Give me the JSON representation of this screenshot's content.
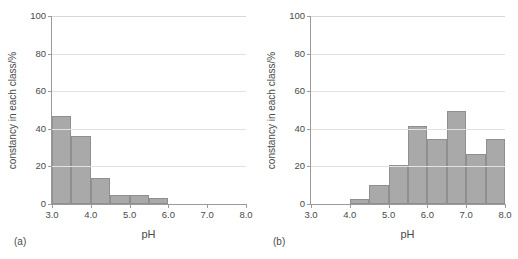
{
  "figure": {
    "background": "#ffffff",
    "bar_fill": "#a9a9a9",
    "bar_edge": "#8f8f8f",
    "axis_color": "#9a9a9a",
    "grid_color": "#e2e2e2"
  },
  "panels": [
    {
      "tag": "(a)",
      "xlabel": "pH",
      "ylabel": "constancy in each class/%"
    },
    {
      "tag": "(b)",
      "xlabel": "pH",
      "ylabel": "constancy in each class/%"
    }
  ],
  "chart_data": [
    {
      "type": "bar",
      "title": "",
      "panel": "(a)",
      "xlabel": "pH",
      "ylabel": "constancy in each class/%",
      "xlim": [
        3.0,
        8.0
      ],
      "ylim": [
        0,
        100
      ],
      "xticks": [
        3.0,
        4.0,
        5.0,
        6.0,
        7.0,
        8.0
      ],
      "xtick_labels": [
        "3.0",
        "4.0",
        "5.0",
        "6.0",
        "7.0",
        "8.0"
      ],
      "yticks": [
        0,
        20,
        40,
        60,
        80,
        100
      ],
      "ytick_labels": [
        "0",
        "20",
        "40",
        "60",
        "80",
        "100"
      ],
      "grid": "horizontal",
      "legend": "none",
      "bin_edges": [
        3.0,
        3.5,
        4.0,
        4.5,
        5.0,
        5.5,
        6.0
      ],
      "categories": [
        "3.0-3.5",
        "3.5-4.0",
        "4.0-4.5",
        "4.5-5.0",
        "5.0-5.5",
        "5.5-6.0"
      ],
      "values": [
        47,
        36,
        14,
        5,
        5,
        3
      ]
    },
    {
      "type": "bar",
      "title": "",
      "panel": "(b)",
      "xlabel": "pH",
      "ylabel": "constancy in each class/%",
      "xlim": [
        3.0,
        8.0
      ],
      "ylim": [
        0,
        100
      ],
      "xticks": [
        3.0,
        4.0,
        5.0,
        6.0,
        7.0,
        8.0
      ],
      "xtick_labels": [
        "3.0",
        "4.0",
        "5.0",
        "6.0",
        "7.0",
        "8.0"
      ],
      "yticks": [
        0,
        20,
        40,
        60,
        80,
        100
      ],
      "ytick_labels": [
        "0",
        "20",
        "40",
        "60",
        "80",
        "100"
      ],
      "grid": "horizontal",
      "legend": "none",
      "bin_edges": [
        4.0,
        4.5,
        5.0,
        5.5,
        6.0,
        6.5,
        7.0,
        7.5,
        8.0
      ],
      "categories": [
        "4.0-4.5",
        "4.5-5.0",
        "5.0-5.5",
        "5.5-6.0",
        "6.0-6.5",
        "6.5-7.0",
        "7.0-7.5",
        "7.5-8.0"
      ],
      "values": [
        2.5,
        10,
        20.5,
        41.5,
        34.5,
        49.5,
        26.5,
        34.5
      ]
    }
  ]
}
